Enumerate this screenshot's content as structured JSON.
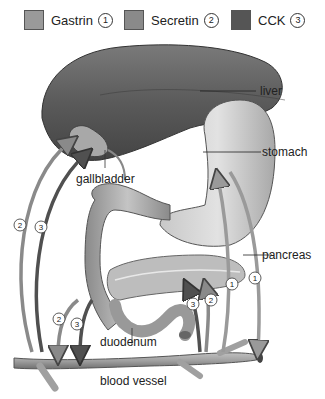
{
  "legend": [
    {
      "label": "Gastrin",
      "number": "1",
      "color": "#9a9a9a"
    },
    {
      "label": "Secretin",
      "number": "2",
      "color": "#8a8a8a"
    },
    {
      "label": "CCK",
      "number": "3",
      "color": "#555555"
    }
  ],
  "labels": {
    "liver": "liver",
    "stomach": "stomach",
    "gallbladder": "gallbladder",
    "pancreas": "pancreas",
    "duodenum": "duodenum",
    "blood_vessel": "blood vessel"
  },
  "arrow_markers": {
    "left_secretin": "2",
    "left_cck": "3",
    "lower_secretin": "2",
    "lower_cck": "3",
    "pancreas_cck": "3",
    "pancreas_secretin": "2",
    "gastrin_up": "1",
    "gastrin_down": "1"
  }
}
